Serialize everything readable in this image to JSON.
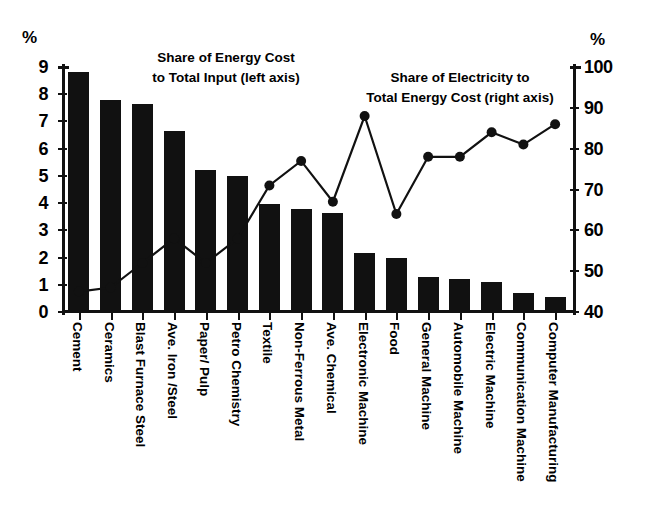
{
  "axes": {
    "left_unit": "%",
    "right_unit": "%",
    "left_ticks": [
      "0",
      "1",
      "2",
      "3",
      "4",
      "5",
      "6",
      "7",
      "8",
      "9"
    ],
    "right_ticks": [
      "40",
      "50",
      "60",
      "70",
      "80",
      "90",
      "100"
    ]
  },
  "annotations": {
    "left": "Share of Energy Cost\nto Total Input (left axis)",
    "right": "Share of Electricity to\nTotal Energy Cost (right axis)"
  },
  "chart_data": {
    "type": "bar",
    "title": "",
    "xlabel": "",
    "ylabel": "%",
    "ylim": [
      0,
      9
    ],
    "y2lim": [
      40,
      100
    ],
    "grid": false,
    "legend_position": "inside-annotations",
    "categories": [
      "Cement",
      "Ceramics",
      "Blast Furnace Steel",
      "Ave. Iron /Steel",
      "Paper/ Pulp",
      "Petro Chemistry",
      "Textile",
      "Non-Ferrous Metal",
      "Ave. Chemical",
      "Electronic Machine",
      "Food",
      "General Machine",
      "Automobile Machine",
      "Electric Machine",
      "Communication Machine",
      "Computer Manufacturing"
    ],
    "series": [
      {
        "name": "Share of Energy Cost to Total Input (left axis)",
        "type": "bar",
        "axis": "left",
        "unit": "%",
        "values": [
          8.8,
          7.8,
          7.65,
          6.65,
          5.2,
          5.0,
          3.95,
          3.8,
          3.65,
          2.15,
          2.0,
          1.3,
          1.2,
          1.1,
          0.7,
          0.55
        ]
      },
      {
        "name": "Share of Electricity to Total Energy Cost (right axis)",
        "type": "line",
        "axis": "right",
        "unit": "%",
        "values": [
          45,
          46,
          52,
          58,
          52,
          58,
          71,
          77,
          67,
          88,
          64,
          78,
          78,
          84,
          81,
          86
        ]
      }
    ]
  }
}
